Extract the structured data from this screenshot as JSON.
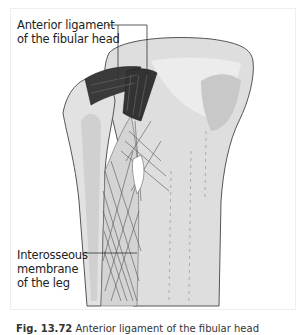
{
  "figure": {
    "labels": {
      "top_line1": "Anterior ligament",
      "top_line2": "of the fibular head",
      "bottom_line1": "Interosseous",
      "bottom_line2": "membrane",
      "bottom_line3": "of the leg"
    },
    "caption": {
      "number": "Fig. 13.72",
      "text": "Anterior ligament of the fibular head"
    },
    "colors": {
      "bone_light": "#e4e4e4",
      "bone_mid": "#cfcfcf",
      "ligament_dark": "#3a3a3a",
      "outline": "#555555",
      "leader_line": "#333333"
    }
  }
}
